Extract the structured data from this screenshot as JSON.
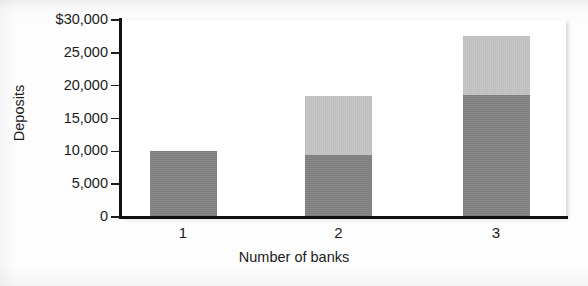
{
  "chart_data": {
    "type": "bar",
    "title": "",
    "subtitle": "",
    "xlabel": "Number of banks",
    "ylabel": "Deposits",
    "categories": [
      "1",
      "2",
      "3"
    ],
    "stacked": true,
    "series": [
      {
        "name": "lower-segment",
        "color": "#808080",
        "values": [
          10000,
          9500,
          18600
        ]
      },
      {
        "name": "upper-segment",
        "color": "#c3c3c3",
        "values": [
          0,
          9000,
          8900
        ]
      }
    ],
    "totals": [
      10000,
      18500,
      27500
    ],
    "ylim": [
      0,
      30000
    ],
    "yticks": [
      0,
      5000,
      10000,
      15000,
      20000,
      25000,
      30000
    ],
    "ytick_labels": [
      "0",
      "5,000",
      "10,000",
      "15,000",
      "20,000",
      "25,000",
      "$30,000"
    ],
    "xtick_labels": [
      "1",
      "2",
      "3"
    ],
    "grid": false,
    "legend": false,
    "legend_position": "none"
  },
  "axes": {
    "y_title": "Deposits",
    "x_title": "Number of banks"
  },
  "colors": {
    "segment_lower": "#808080",
    "segment_upper": "#c3c3c3",
    "axis": "#111111",
    "plot_background": "#ffffff",
    "page_background": "#fdfdfd"
  }
}
